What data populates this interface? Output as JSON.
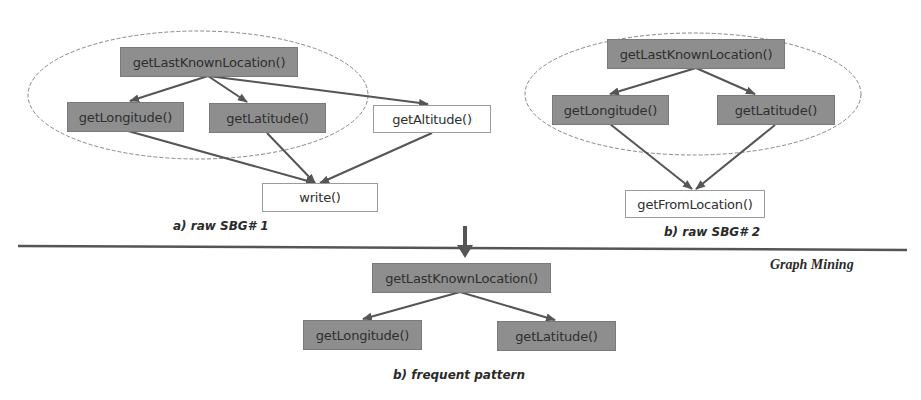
{
  "diagram": {
    "section_label": "Graph Mining",
    "graph_a": {
      "caption": "a) raw SBG# 1",
      "nodes": {
        "root": "getLastKnownLocation()",
        "longitude": "getLongitude()",
        "latitude": "getLatitude()",
        "altitude": "getAltitude()",
        "write": "write()"
      }
    },
    "graph_b": {
      "caption": "b) raw SBG# 2",
      "nodes": {
        "root": "getLastKnownLocation()",
        "longitude": "getLongitude()",
        "latitude": "getLatitude()",
        "from_location": "getFromLocation()"
      }
    },
    "pattern": {
      "caption": "b) frequent pattern",
      "nodes": {
        "root": "getLastKnownLocation()",
        "longitude": "getLongitude()",
        "latitude": "getLatitude()"
      }
    },
    "colors": {
      "highlighted_node": "#8e8e8e",
      "plain_node": "#ffffff",
      "edge": "#555555",
      "ellipse": "#888888",
      "divider": "#555555"
    }
  }
}
